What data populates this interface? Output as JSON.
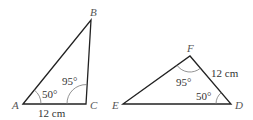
{
  "triangles": [
    {
      "name": "ABC",
      "vertices": {
        "A": "A",
        "B": "B",
        "C": "C"
      },
      "angle_A": "50°",
      "angle_C": "95°",
      "side_AC": "12 cm"
    },
    {
      "name": "DEF",
      "vertices": {
        "D": "D",
        "E": "E",
        "F": "F"
      },
      "angle_F": "95°",
      "angle_D": "50°",
      "side_FD": "12 cm"
    }
  ],
  "colors": {
    "stroke": "#222222",
    "arc": "#777777",
    "text": "#333333"
  }
}
